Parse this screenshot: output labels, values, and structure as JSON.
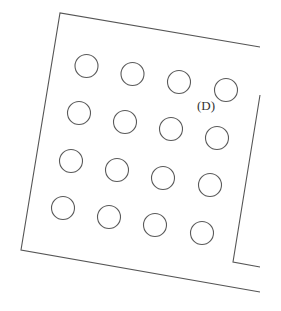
{
  "diagram": {
    "label": "(D)",
    "label_position": {
      "x": 197,
      "y": 110
    },
    "stroke_color": "#555555",
    "outline": {
      "left_top_edge": [
        [
          260,
          47
        ],
        [
          60,
          13
        ],
        [
          21,
          250
        ],
        [
          260,
          292
        ]
      ],
      "right_edge": [
        [
          260,
          95
        ],
        [
          233,
          262
        ],
        [
          260,
          267
        ]
      ]
    },
    "circle_radius": 11.5,
    "circles": [
      {
        "row": 1,
        "col": 1,
        "cx": 86.5,
        "cy": 66
      },
      {
        "row": 1,
        "col": 2,
        "cx": 132.5,
        "cy": 74
      },
      {
        "row": 1,
        "col": 3,
        "cx": 179,
        "cy": 82
      },
      {
        "row": 1,
        "col": 4,
        "cx": 226,
        "cy": 90
      },
      {
        "row": 2,
        "col": 1,
        "cx": 79,
        "cy": 113
      },
      {
        "row": 2,
        "col": 2,
        "cx": 125,
        "cy": 122
      },
      {
        "row": 2,
        "col": 3,
        "cx": 171,
        "cy": 129
      },
      {
        "row": 2,
        "col": 4,
        "cx": 217,
        "cy": 138
      },
      {
        "row": 3,
        "col": 1,
        "cx": 71,
        "cy": 161
      },
      {
        "row": 3,
        "col": 2,
        "cx": 117,
        "cy": 170
      },
      {
        "row": 3,
        "col": 3,
        "cx": 163,
        "cy": 178
      },
      {
        "row": 3,
        "col": 4,
        "cx": 210,
        "cy": 185
      },
      {
        "row": 4,
        "col": 1,
        "cx": 63,
        "cy": 208
      },
      {
        "row": 4,
        "col": 2,
        "cx": 109,
        "cy": 217
      },
      {
        "row": 4,
        "col": 3,
        "cx": 155,
        "cy": 225
      },
      {
        "row": 4,
        "col": 4,
        "cx": 202,
        "cy": 233
      }
    ]
  }
}
